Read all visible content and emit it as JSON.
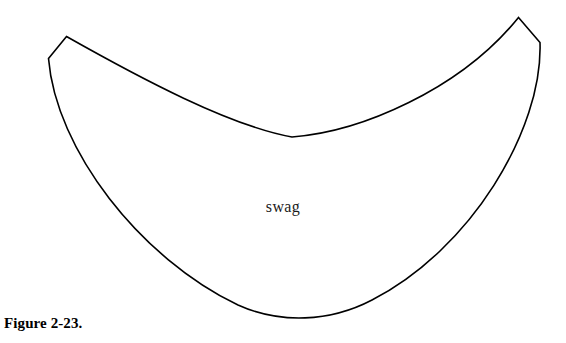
{
  "figure": {
    "caption": "Figure 2-23.",
    "label": "swag",
    "background_color": "#ffffff",
    "line_color": "#000000",
    "fill_color": "#ffffff",
    "shape_name": "swag-curtain-pattern"
  },
  "geometry": {
    "top_left_outer": [
      48,
      58
    ],
    "top_left_peak": [
      66,
      36
    ],
    "top_right_peak": [
      519,
      17
    ],
    "top_right_outer": [
      540,
      42
    ],
    "inner_curve_bottom": [
      292,
      137
    ],
    "outer_curve_bottom": [
      312,
      318
    ]
  }
}
